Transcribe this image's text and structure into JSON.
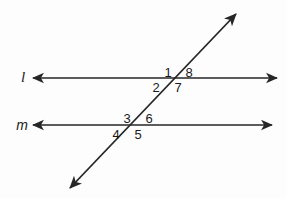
{
  "figure": {
    "background_color": "#fdfdfd",
    "stroke_color": "#262626",
    "text_color": "#1a1a1a"
  },
  "lines": {
    "l": {
      "label": "l",
      "label_x": 23,
      "label_y": 77,
      "x1": 33,
      "y1": 78,
      "x2": 277,
      "y2": 78,
      "arrows": "both"
    },
    "m": {
      "label": "m",
      "label_x": 22,
      "label_y": 125,
      "x1": 33,
      "y1": 125,
      "x2": 272,
      "y2": 125,
      "arrows": "both"
    },
    "transversal": {
      "label": "",
      "x1": 70,
      "y1": 188,
      "x2": 236,
      "y2": 14,
      "arrows": "both"
    }
  },
  "intersections": [
    {
      "name": "upper",
      "line": "l",
      "x": 172,
      "y": 78
    },
    {
      "name": "lower",
      "line": "m",
      "x": 132,
      "y": 125
    }
  ],
  "angle_labels": [
    {
      "id": "1",
      "text": "1",
      "x": 168,
      "y": 72,
      "intersection": "upper",
      "position": "above-left"
    },
    {
      "id": "8",
      "text": "8",
      "x": 189,
      "y": 72,
      "intersection": "upper",
      "position": "above-right"
    },
    {
      "id": "2",
      "text": "2",
      "x": 156,
      "y": 87,
      "intersection": "upper",
      "position": "below-left"
    },
    {
      "id": "7",
      "text": "7",
      "x": 178,
      "y": 87,
      "intersection": "upper",
      "position": "below-right"
    },
    {
      "id": "3",
      "text": "3",
      "x": 127,
      "y": 118,
      "intersection": "lower",
      "position": "above-left"
    },
    {
      "id": "6",
      "text": "6",
      "x": 149,
      "y": 118,
      "intersection": "lower",
      "position": "above-right"
    },
    {
      "id": "4",
      "text": "4",
      "x": 116,
      "y": 134,
      "intersection": "lower",
      "position": "below-left"
    },
    {
      "id": "5",
      "text": "5",
      "x": 138,
      "y": 134,
      "intersection": "lower",
      "position": "below-right"
    }
  ]
}
